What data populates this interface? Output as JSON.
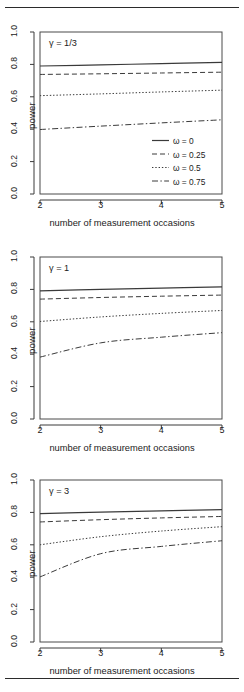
{
  "figure": {
    "ylabel": "power",
    "xlabel": "number of measurement occasions",
    "ytick_labels": [
      "0.0",
      "0.2",
      "0.4",
      "0.6",
      "0.8",
      "1.0"
    ],
    "xtick_labels": [
      "2",
      "3",
      "4",
      "5"
    ],
    "panel_labels": [
      "γ = 1/3",
      "γ = 1",
      "γ = 3"
    ],
    "legend": [
      {
        "label": "ω = 0",
        "style": "solid"
      },
      {
        "label": "ω = 0.25",
        "style": "dashed"
      },
      {
        "label": "ω = 0.5",
        "style": "dotted"
      },
      {
        "label": "ω = 0.75",
        "style": "dashdot"
      }
    ],
    "line_color": "#3a3a3a"
  },
  "chart_data": [
    {
      "type": "line",
      "title": "γ = 1/3",
      "xlabel": "number of measurement occasions",
      "ylabel": "power",
      "xlim": [
        2,
        5
      ],
      "ylim": [
        0.0,
        1.0
      ],
      "xticks": [
        2,
        3,
        4,
        5
      ],
      "yticks": [
        0.0,
        0.2,
        0.4,
        0.6,
        0.8,
        1.0
      ],
      "grid": false,
      "legend_position": "lower right",
      "x": [
        2,
        3,
        4,
        5
      ],
      "series": [
        {
          "name": "ω = 0",
          "style": "solid",
          "values": [
            0.79,
            0.797,
            0.805,
            0.812
          ]
        },
        {
          "name": "ω = 0.25",
          "style": "dashed",
          "values": [
            0.738,
            0.742,
            0.747,
            0.752
          ]
        },
        {
          "name": "ω = 0.5",
          "style": "dotted",
          "values": [
            0.607,
            0.618,
            0.63,
            0.641
          ]
        },
        {
          "name": "ω = 0.75",
          "style": "dashdot",
          "values": [
            0.398,
            0.419,
            0.439,
            0.458
          ]
        }
      ]
    },
    {
      "type": "line",
      "title": "γ = 1",
      "xlabel": "number of measurement occasions",
      "ylabel": "power",
      "xlim": [
        2,
        5
      ],
      "ylim": [
        0.0,
        1.0
      ],
      "xticks": [
        2,
        3,
        4,
        5
      ],
      "yticks": [
        0.0,
        0.2,
        0.4,
        0.6,
        0.8,
        1.0
      ],
      "grid": false,
      "legend_position": "none",
      "x": [
        2,
        3,
        4,
        5
      ],
      "series": [
        {
          "name": "ω = 0",
          "style": "solid",
          "values": [
            0.791,
            0.8,
            0.808,
            0.815
          ]
        },
        {
          "name": "ω = 0.25",
          "style": "dashed",
          "values": [
            0.74,
            0.75,
            0.758,
            0.765
          ]
        },
        {
          "name": "ω = 0.5",
          "style": "dotted",
          "values": [
            0.602,
            0.63,
            0.652,
            0.67
          ]
        },
        {
          "name": "ω = 0.75",
          "style": "dashdot",
          "values": [
            0.382,
            0.47,
            0.505,
            0.533
          ]
        }
      ]
    },
    {
      "type": "line",
      "title": "γ = 3",
      "xlabel": "number of measurement occasions",
      "ylabel": "power",
      "xlim": [
        2,
        5
      ],
      "ylim": [
        0.0,
        1.0
      ],
      "xticks": [
        2,
        3,
        4,
        5
      ],
      "yticks": [
        0.0,
        0.2,
        0.4,
        0.6,
        0.8,
        1.0
      ],
      "grid": false,
      "legend_position": "none",
      "x": [
        2,
        3,
        4,
        5
      ],
      "series": [
        {
          "name": "ω = 0",
          "style": "solid",
          "values": [
            0.792,
            0.802,
            0.81,
            0.817
          ]
        },
        {
          "name": "ω = 0.25",
          "style": "dashed",
          "values": [
            0.741,
            0.755,
            0.766,
            0.775
          ]
        },
        {
          "name": "ω = 0.5",
          "style": "dotted",
          "values": [
            0.6,
            0.65,
            0.685,
            0.712
          ]
        },
        {
          "name": "ω = 0.75",
          "style": "dashdot",
          "values": [
            0.402,
            0.545,
            0.59,
            0.625
          ]
        }
      ]
    }
  ]
}
